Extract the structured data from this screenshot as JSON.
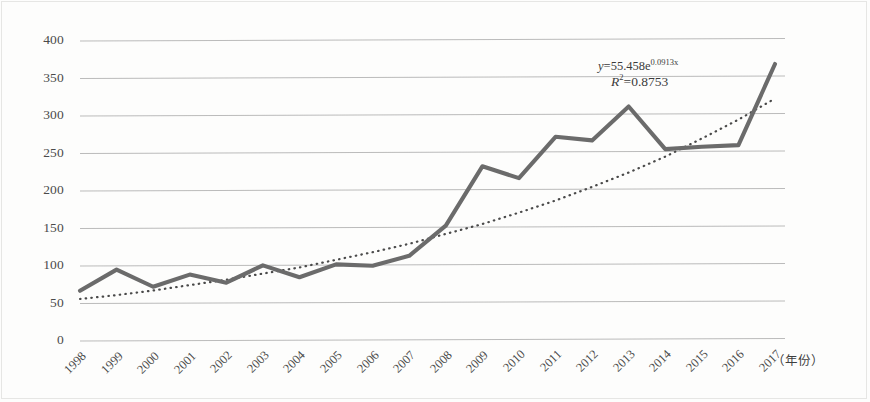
{
  "chart_data": {
    "type": "line",
    "title": "",
    "subtitle": "",
    "xlabel": "（年份）",
    "ylabel": "",
    "categories": [
      "1998",
      "1999",
      "2000",
      "2001",
      "2002",
      "2003",
      "2004",
      "2005",
      "2006",
      "2007",
      "2008",
      "2009",
      "2010",
      "2011",
      "2012",
      "2013",
      "2014",
      "2015",
      "2016",
      "2017"
    ],
    "x": [
      1998,
      1999,
      2000,
      2001,
      2002,
      2003,
      2004,
      2005,
      2006,
      2007,
      2008,
      2009,
      2010,
      2011,
      2012,
      2013,
      2014,
      2015,
      2016,
      2017
    ],
    "series": [
      {
        "name": "数量",
        "type": "line",
        "color": "#6b6b6b",
        "values": [
          67,
          95,
          72,
          88,
          77,
          100,
          84,
          101,
          99,
          112,
          152,
          231,
          215,
          270,
          265,
          310,
          253,
          256,
          258,
          366
        ]
      },
      {
        "name": "指数趋势线",
        "type": "trendline",
        "style": "dotted",
        "color": "#4a4a4a",
        "values": [
          56,
          61,
          67,
          74,
          81,
          89,
          97,
          107,
          117,
          128,
          141,
          154,
          169,
          185,
          203,
          222,
          243,
          267,
          292,
          320
        ]
      }
    ],
    "annotations": [
      {
        "name": "trendline-equation",
        "text": "y=55.458e0.0913x",
        "parts": {
          "lhs": "y",
          "equals": "=",
          "coefficient": "55.458",
          "base": "e",
          "exponent": "0.0913x"
        }
      },
      {
        "name": "r-squared",
        "text": "R2=0.8753",
        "parts": {
          "symbol": "R",
          "superscript": "2",
          "equals": "=",
          "value": "0.8753"
        }
      }
    ],
    "yticks": [
      0,
      50,
      100,
      150,
      200,
      250,
      300,
      350,
      400
    ],
    "ytick_labels": [
      "0",
      "50",
      "100",
      "150",
      "200",
      "250",
      "300",
      "350",
      "400"
    ],
    "ylim": [
      0,
      400
    ],
    "xlim": [
      1998,
      2017
    ],
    "grid": true,
    "grid_axis": "y",
    "legend": false,
    "colors": {
      "data_line": "#6b6b6b",
      "trendline": "#4a4a4a",
      "gridline": "#a9a9a9",
      "text": "#3f3f3f",
      "background": "#fdfdfc"
    }
  }
}
